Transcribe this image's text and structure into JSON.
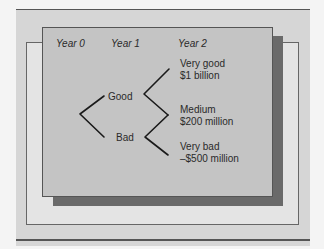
{
  "diagram": {
    "type": "decision-tree",
    "columns": [
      {
        "label": "Year 0"
      },
      {
        "label": "Year 1"
      },
      {
        "label": "Year 2"
      }
    ],
    "year1_nodes": [
      {
        "label": "Good"
      },
      {
        "label": "Bad"
      }
    ],
    "year2_outcomes": [
      {
        "name": "Very good",
        "value": "$1 billion"
      },
      {
        "name": "Medium",
        "value": "$200 million"
      },
      {
        "name": "Very bad",
        "value": "–$500 million"
      }
    ],
    "colors": {
      "page_background": "#f4f4f4",
      "outer_panel": "#d6d6d6",
      "back_frame": "#e4e4e4",
      "shadow": "#6a6a6a",
      "front_panel": "#c4c4c4",
      "lines": "#1a1a1a"
    }
  }
}
